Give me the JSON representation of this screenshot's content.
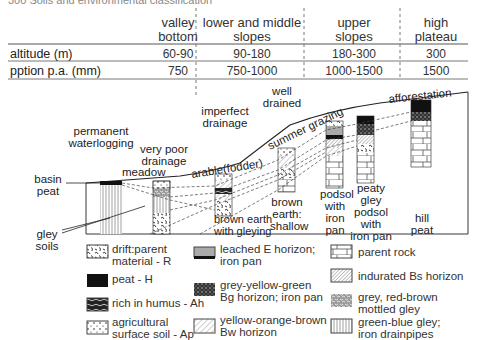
{
  "top_cut_text": "300   Soils and environmental classification",
  "columns": [
    {
      "label": "valley\nbottom"
    },
    {
      "label": "lower and middle\nslopes"
    },
    {
      "label": "upper\nslopes"
    },
    {
      "label": "high\nplateau"
    }
  ],
  "rows": [
    {
      "label": "altitude (m)",
      "values": [
        "60-90",
        "90-180",
        "180-300",
        "300"
      ]
    },
    {
      "label": "pption p.a. (mm)",
      "values": [
        "750",
        "750-1000",
        "1000-1500",
        "1500"
      ]
    }
  ],
  "diagram": {
    "drainage_labels": [
      "permanent\nwaterlogging",
      "very poor\ndrainage",
      "imperfect\ndrainage",
      "well\ndrained"
    ],
    "landuse_labels": [
      "meadow",
      "arable(fodder)",
      "summer grazing",
      "afforestation"
    ],
    "side_labels": [
      "basin\npeat",
      "gley\nsoils"
    ],
    "soil_labels": [
      "brown earth\nwith gleying",
      "brown\nearth:\nshallow",
      "podsol\nwith\niron\npan",
      "peaty\ngley\npodsol\nwith\niron pan",
      "hill\npeat"
    ]
  },
  "legend": [
    {
      "label": "drift:parent\nmaterial - R",
      "pattern": "drift"
    },
    {
      "label": "peat - H",
      "pattern": "peat"
    },
    {
      "label": "rich in humus - Ah",
      "pattern": "humus"
    },
    {
      "label": "agricultural\nsurface soil - Ap",
      "pattern": "dots"
    },
    {
      "label": "leached E horizon;\niron pan",
      "pattern": "leached"
    },
    {
      "label": "grey-yellow-green\nBg horizon; iron pan",
      "pattern": "bg"
    },
    {
      "label": "yellow-orange-brown\nBw horizon",
      "pattern": "bw"
    },
    {
      "label": "parent rock",
      "pattern": "rock"
    },
    {
      "label": "indurated Bs horizon",
      "pattern": "bs"
    },
    {
      "label": "grey, red-brown\nmottled gley",
      "pattern": "mottled"
    },
    {
      "label": "green-blue gley;\niron drainpipes",
      "pattern": "gley"
    }
  ]
}
